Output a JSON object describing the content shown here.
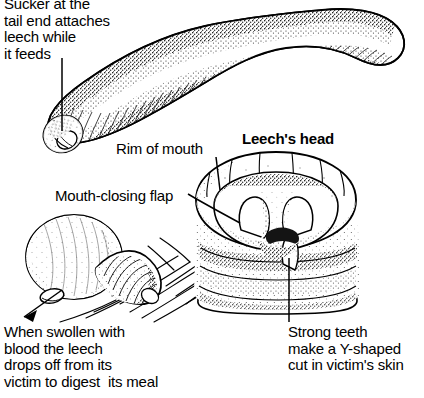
{
  "figure": {
    "width": 424,
    "height": 398,
    "background_color": "#ffffff",
    "ink_color": "#000000",
    "style": "black-and-white stipple line engraving"
  },
  "captions": {
    "sucker": "Sucker at the\ntail end attaches\nleech while\nit feeds",
    "rim_of_mouth": "Rim of mouth",
    "leechs_head": "Leech's head",
    "mouth_closing_flap": "Mouth-closing flap",
    "swollen": "When swollen with\nblood the leech\ndrops off from its\nvictim to digest  its meal",
    "strong_teeth": "Strong teeth\nmake a Y-shaped\ncut in victim's skin"
  },
  "illustrations": [
    {
      "name": "whole-leech",
      "description": "Elongated segmented leech body curving from lower-left tail sucker up and to the right"
    },
    {
      "name": "engorged-leech",
      "description": "Blood-swollen leech dropping off the victim's skin"
    },
    {
      "name": "leech-head-mouth",
      "description": "Close-up of the leech head with open mouth showing three jaws with teeth"
    }
  ],
  "leader_lines": [
    {
      "name": "sucker-leader",
      "from": [
        62,
        58
      ],
      "to": [
        62,
        131
      ]
    },
    {
      "name": "rim-leader",
      "from": [
        216,
        157
      ],
      "to": [
        220,
        188
      ]
    },
    {
      "name": "flap-leader",
      "from": [
        190,
        197
      ],
      "to": [
        238,
        222
      ]
    },
    {
      "name": "teeth-leader",
      "from": [
        289,
        265
      ],
      "to": [
        289,
        322
      ]
    },
    {
      "name": "swollen-arrow",
      "from": [
        60,
        292
      ],
      "to": [
        22,
        318
      ]
    }
  ]
}
